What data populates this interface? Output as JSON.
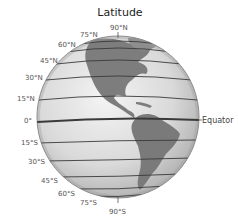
{
  "diagram": {
    "title": "Latitude",
    "equator_label": "Equator",
    "north_pole_label": "90°N",
    "south_pole_label": "90°S",
    "labels": {
      "n75": "75°N",
      "n60": "60°N",
      "n45": "45°N",
      "n30": "30°N",
      "n15": "15°N",
      "zero": "0°",
      "s15": "15°S",
      "s30": "30°S",
      "s45": "45°S",
      "s60": "60°S",
      "s75": "75°S"
    },
    "colors": {
      "ocean": "#d6d6d6",
      "land": "#7a7a7a",
      "lines": "#3a3a3a",
      "outline": "#8a8a8a"
    }
  }
}
